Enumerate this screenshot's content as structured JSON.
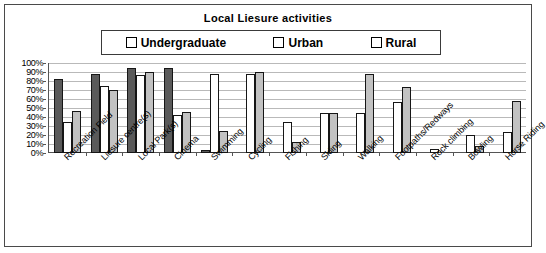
{
  "chart_data": {
    "type": "bar",
    "title": "Local Liesure activities",
    "xlabel": "",
    "ylabel": "",
    "ylim": [
      0,
      100
    ],
    "grid": true,
    "legend_position": "top-center",
    "y_ticks": [
      "100%",
      "90%",
      "80%",
      "70%",
      "60%",
      "50%",
      "40%",
      "30%",
      "20%",
      "10%",
      "0%"
    ],
    "categories": [
      "Recreation Field",
      "Liesure centre(s)",
      "Local Park(s)",
      "Cinema",
      "Swimming",
      "Cycling",
      "Fishing",
      "Skiing",
      "Walking",
      "Footpaths/Redways",
      "Rock climbing",
      "Bowling",
      "Horse Riding"
    ],
    "series": [
      {
        "name": "Undergraduate",
        "color": "#5a5a5a",
        "values": [
          82,
          88,
          95,
          95,
          3,
          0,
          0,
          0,
          0,
          0,
          0,
          0,
          0
        ]
      },
      {
        "name": "Urban",
        "color": "#ffffff",
        "values": [
          35,
          75,
          87,
          42,
          88,
          88,
          35,
          45,
          45,
          57,
          5,
          20,
          23
        ]
      },
      {
        "name": "Rural",
        "color": "#c2c2c2",
        "values": [
          47,
          70,
          90,
          46,
          25,
          90,
          12,
          45,
          88,
          73,
          0,
          8,
          58
        ]
      }
    ]
  },
  "legend": {
    "entries": [
      {
        "label": "Undergraduate",
        "swatch": "dark-gray-swatch"
      },
      {
        "label": "Urban",
        "swatch": "white-swatch"
      },
      {
        "label": "Rural",
        "swatch": "light-gray-swatch"
      }
    ]
  }
}
